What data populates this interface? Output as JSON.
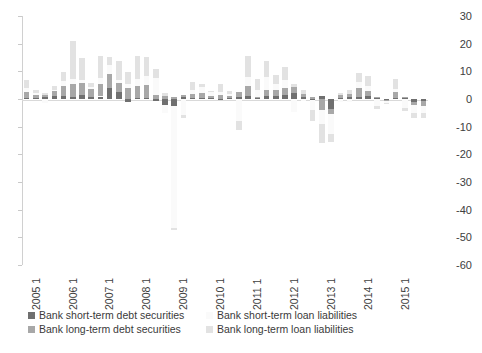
{
  "chart_data": {
    "type": "bar",
    "stacked": true,
    "title": "",
    "subtitle": "",
    "xlabel": "",
    "ylabel": "",
    "ylim": [
      -60,
      30
    ],
    "yticks": [
      30,
      20,
      10,
      0,
      -10,
      -20,
      -30,
      -40,
      -50,
      -60
    ],
    "ytick_labels": [
      "30",
      "20",
      "10",
      "0",
      "-10",
      "-20",
      "-30",
      "-40",
      "-50",
      "-60"
    ],
    "y_axis_position": "right",
    "grid": false,
    "legend_position": "bottom",
    "x_tick_labels": [
      "2005 1",
      "2006 1",
      "2007 1",
      "2008 1",
      "2009 1",
      "2010 1",
      "2011 1",
      "2012 1",
      "2013 1",
      "2014 1",
      "2015 1"
    ],
    "x_tick_indices": [
      0,
      4,
      8,
      12,
      16,
      20,
      24,
      28,
      32,
      36,
      40
    ],
    "categories": [
      "2005 1",
      "2005 2",
      "2005 3",
      "2005 4",
      "2006 1",
      "2006 2",
      "2006 3",
      "2006 4",
      "2007 1",
      "2007 2",
      "2007 3",
      "2007 4",
      "2008 1",
      "2008 2",
      "2008 3",
      "2008 4",
      "2009 1",
      "2009 2",
      "2009 3",
      "2009 4",
      "2010 1",
      "2010 2",
      "2010 3",
      "2010 4",
      "2011 1",
      "2011 2",
      "2011 3",
      "2011 4",
      "2012 1",
      "2012 2",
      "2012 3",
      "2012 4",
      "2013 1",
      "2013 2",
      "2013 3",
      "2013 4",
      "2014 1",
      "2014 2",
      "2014 3",
      "2014 4",
      "2015 1",
      "2015 2",
      "2015 3",
      "2015 4"
    ],
    "series": [
      {
        "name": "Bank short-term debt securities",
        "key": "stds",
        "color": "#6f6f6f",
        "values": [
          0.2,
          0.3,
          0.8,
          1.2,
          1.0,
          0.6,
          1.5,
          0.7,
          0.9,
          4.0,
          2.5,
          -1.0,
          0.4,
          0.5,
          -0.6,
          -2.0,
          -2.5,
          0.9,
          0.3,
          0.4,
          0.2,
          -0.4,
          0.5,
          0.6,
          1.0,
          0.3,
          1.2,
          1.0,
          1.3,
          2.0,
          0.8,
          -0.5,
          1.1,
          -3.5,
          0.4,
          0.8,
          0.9,
          1.0,
          0.5,
          -0.4,
          0.2,
          0.3,
          -1.2,
          -0.8
        ]
      },
      {
        "name": "Bank long-term debt securities",
        "key": "ltds",
        "color": "#a8a8a8",
        "values": [
          2.4,
          1.2,
          0.8,
          1.6,
          3.8,
          4.8,
          4.2,
          3.0,
          4.5,
          5.2,
          3.2,
          3.8,
          4.4,
          4.6,
          1.5,
          1.2,
          0.8,
          0.6,
          1.6,
          1.8,
          1.0,
          1.4,
          0.6,
          1.8,
          3.8,
          0.5,
          2.0,
          2.4,
          2.8,
          2.2,
          1.0,
          0.8,
          -4.0,
          -2.0,
          0.9,
          1.0,
          3.2,
          2.0,
          0.4,
          -0.5,
          2.4,
          0.6,
          -1.0,
          -1.6
        ]
      },
      {
        "name": "Bank short-term loan liabilities",
        "key": "stll",
        "color": "#fafafa",
        "values": [
          1.2,
          0.6,
          -1.4,
          0.5,
          1.6,
          2.0,
          1.0,
          0.6,
          2.2,
          3.0,
          1.2,
          1.8,
          2.6,
          3.2,
          6.0,
          -3.0,
          -44.0,
          -5.8,
          1.4,
          2.0,
          1.2,
          1.0,
          0.8,
          -8.0,
          3.0,
          2.6,
          4.6,
          2.2,
          2.8,
          -4.8,
          -0.8,
          -3.4,
          -5.0,
          -7.0,
          -1.2,
          -1.0,
          2.0,
          1.6,
          -2.4,
          -0.6,
          1.0,
          -3.4,
          -3.0,
          -2.6
        ]
      },
      {
        "name": "Bank long-term loan liabilities",
        "key": "ltll",
        "color": "#e2e2e2",
        "values": [
          3.0,
          1.0,
          0.6,
          1.4,
          3.2,
          13.6,
          8.0,
          1.4,
          8.0,
          3.0,
          7.0,
          4.0,
          8.0,
          7.0,
          3.4,
          1.0,
          -1.0,
          -1.0,
          3.0,
          1.2,
          0.6,
          3.2,
          1.0,
          -3.2,
          7.6,
          4.0,
          6.0,
          3.0,
          4.6,
          1.2,
          1.6,
          -4.0,
          -7.0,
          -3.0,
          1.0,
          1.4,
          3.4,
          3.6,
          -1.2,
          -0.4,
          3.6,
          -1.0,
          -1.6,
          -1.8
        ]
      }
    ]
  },
  "legend": {
    "items": [
      {
        "label": "Bank short-term debt securities",
        "swatch": "#6f6f6f",
        "key": "stds"
      },
      {
        "label": "Bank long-term debt securities",
        "swatch": "#a8a8a8",
        "key": "ltds"
      },
      {
        "label": "Bank short-term loan liabilities",
        "swatch": "#fafafa",
        "key": "stll"
      },
      {
        "label": "Bank long-term loan liabilities",
        "swatch": "#e2e2e2",
        "key": "ltll"
      }
    ]
  }
}
